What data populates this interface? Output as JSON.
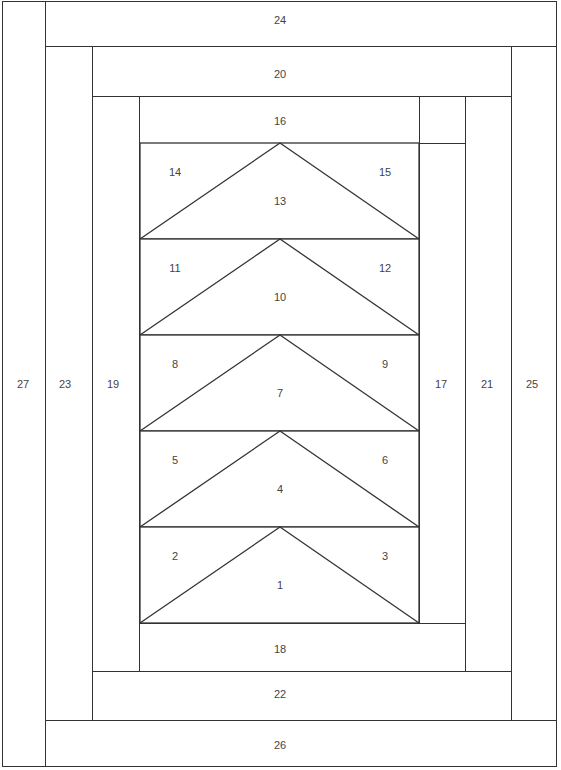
{
  "line_color": "#333333",
  "background_color": "#ffffff",
  "pieces": [
    {
      "id": "27",
      "x": 2,
      "y": 1,
      "w": 44,
      "h": 766,
      "lx": 23,
      "ly": 384
    },
    {
      "id": "24",
      "x": 45,
      "y": 1,
      "w": 512,
      "h": 46,
      "lx": 280,
      "ly": 20
    },
    {
      "id": "25",
      "x": 511,
      "y": 46,
      "w": 46,
      "h": 675,
      "lx": 532,
      "ly": 384
    },
    {
      "id": "26",
      "x": 45,
      "y": 720,
      "w": 512,
      "h": 47,
      "lx": 280,
      "ly": 745
    },
    {
      "id": "23",
      "x": 45,
      "y": 46,
      "w": 48,
      "h": 675,
      "lx": 65,
      "ly": 384
    },
    {
      "id": "20",
      "x": 92,
      "y": 46,
      "w": 420,
      "h": 51,
      "lx": 280,
      "ly": 74
    },
    {
      "id": "21",
      "x": 465,
      "y": 96,
      "w": 47,
      "h": 576,
      "lx": 487,
      "ly": 384
    },
    {
      "id": "22",
      "x": 92,
      "y": 671,
      "w": 420,
      "h": 50,
      "lx": 280,
      "ly": 694
    },
    {
      "id": "19",
      "x": 92,
      "y": 96,
      "w": 48,
      "h": 576,
      "lx": 113,
      "ly": 384
    },
    {
      "id": "16",
      "x": 139,
      "y": 96,
      "w": 281,
      "h": 48,
      "lx": 280,
      "ly": 121
    },
    {
      "id": "17",
      "x": 419,
      "y": 143,
      "w": 47,
      "h": 481,
      "lx": 441,
      "ly": 384
    },
    {
      "id": "18",
      "x": 139,
      "y": 623,
      "w": 327,
      "h": 49,
      "lx": 280,
      "ly": 649
    }
  ],
  "geese": {
    "x_left": 140,
    "x_right": 419,
    "apex_x": 280,
    "rows": [
      {
        "top": 143,
        "bottom": 239,
        "left": "14",
        "center": "13",
        "right": "15"
      },
      {
        "top": 239,
        "bottom": 335,
        "left": "11",
        "center": "10",
        "right": "12"
      },
      {
        "top": 335,
        "bottom": 431,
        "left": "8",
        "center": "7",
        "right": "9"
      },
      {
        "top": 431,
        "bottom": 527,
        "left": "5",
        "center": "4",
        "right": "6"
      },
      {
        "top": 527,
        "bottom": 623,
        "left": "2",
        "center": "1",
        "right": "3"
      }
    ]
  }
}
